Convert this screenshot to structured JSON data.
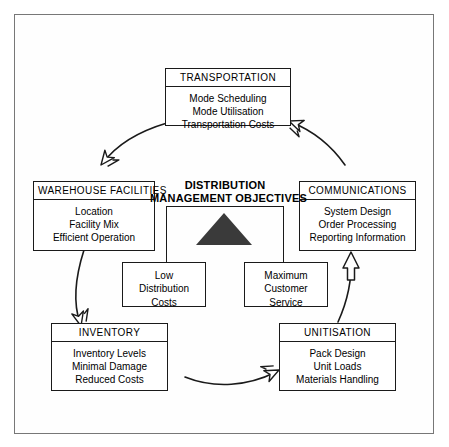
{
  "diagram": {
    "center": {
      "heading_line1": "DISTRIBUTION",
      "heading_line2": "MANAGEMENT OBJECTIVES",
      "symbol": "filled-triangle",
      "sub_boxes": [
        {
          "name": "low-distribution-costs",
          "lines": [
            "Low",
            "Distribution",
            "Costs"
          ]
        },
        {
          "name": "maximum-customer-service",
          "lines": [
            "Maximum",
            "Customer",
            "Service"
          ]
        }
      ]
    },
    "nodes": [
      {
        "id": "transportation",
        "title": "TRANSPORTATION",
        "items": [
          "Mode Scheduling",
          "Mode Utilisation",
          "Transportation Costs"
        ]
      },
      {
        "id": "communications",
        "title": "COMMUNICATIONS",
        "items": [
          "System Design",
          "Order Processing",
          "Reporting Information"
        ]
      },
      {
        "id": "unitisation",
        "title": "UNITISATION",
        "items": [
          "Pack Design",
          "Unit Loads",
          "Materials Handling"
        ]
      },
      {
        "id": "inventory",
        "title": "INVENTORY",
        "items": [
          "Inventory Levels",
          "Minimal Damage",
          "Reduced Costs"
        ]
      },
      {
        "id": "warehouse-facilities",
        "title": "WAREHOUSE FACILITIES",
        "items": [
          "Location",
          "Facility Mix",
          "Efficient Operation"
        ]
      }
    ],
    "arrows": [
      {
        "from": "transportation",
        "to": "warehouse-facilities",
        "style": "open-outline-arrowhead"
      },
      {
        "from": "warehouse-facilities",
        "to": "inventory",
        "style": "open-outline-arrowhead"
      },
      {
        "from": "inventory",
        "to": "unitisation",
        "style": "open-outline-arrowhead"
      },
      {
        "from": "unitisation",
        "to": "communications",
        "style": "hollow-block-arrow"
      },
      {
        "from": "communications",
        "to": "transportation",
        "style": "open-outline-arrowhead"
      }
    ],
    "colors": {
      "line": "#1a1a1a",
      "triangle_fill": "#3a3a3a",
      "frame": "#777777",
      "background": "#ffffff"
    }
  }
}
